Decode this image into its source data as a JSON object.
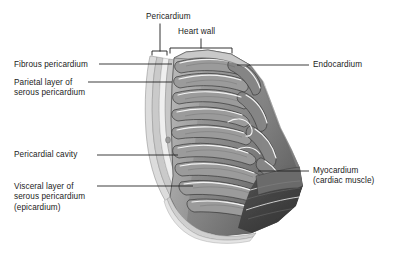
{
  "figure": {
    "type": "anatomical-illustration",
    "style": "grayscale textbook line-and-tone drawing",
    "background_color": "#ffffff",
    "line_color": "#1b1b1b",
    "text_color": "#1b1b1b"
  },
  "brackets": [
    {
      "id": "pericardium",
      "label": "Pericardium",
      "label_x": 146,
      "label_y": 12,
      "span_left": 152,
      "span_right": 167,
      "bracket_y": 51,
      "stem_x": 160,
      "stem_top": 24
    },
    {
      "id": "heart-wall",
      "label": "Heart wall",
      "label_x": 178,
      "label_y": 27,
      "span_left": 170,
      "span_right": 232,
      "bracket_y": 48,
      "stem_x": 201,
      "stem_top": 39
    }
  ],
  "labels": {
    "fibrous_pericardium": {
      "text": "Fibrous pericardium",
      "x": 14,
      "y": 60,
      "side": "left",
      "leader": {
        "x1": 99,
        "y1": 64,
        "x2": 172,
        "y2": 64
      }
    },
    "parietal_layer": {
      "line1": "Parietal layer of",
      "line2": "serous pericardium",
      "x": 14,
      "y": 78,
      "side": "left",
      "leader": {
        "x1": 88,
        "y1": 82,
        "x2": 172,
        "y2": 82
      }
    },
    "pericardial_cavity": {
      "text": "Pericardial cavity",
      "x": 14,
      "y": 150,
      "side": "left",
      "leader": {
        "x1": 97,
        "y1": 155,
        "x2": 178,
        "y2": 155
      }
    },
    "visceral_layer": {
      "line1": "Visceral layer of",
      "line2": "serous pericardium",
      "line3": "(epicardium)",
      "x": 14,
      "y": 182,
      "side": "left",
      "leader": {
        "x1": 97,
        "y1": 186,
        "x2": 193,
        "y2": 186
      }
    },
    "endocardium": {
      "text": "Endocardium",
      "x": 313,
      "y": 60,
      "side": "right",
      "leader": {
        "x1": 237,
        "y1": 65,
        "x2": 309,
        "y2": 65
      }
    },
    "myocardium": {
      "line1": "Myocardium",
      "line2": "(cardiac muscle)",
      "x": 313,
      "y": 166,
      "side": "right",
      "leader": {
        "x1": 258,
        "y1": 171,
        "x2": 309,
        "y2": 171
      }
    }
  },
  "tissue": {
    "outer_pericardium_tone": "#d9d9d9",
    "serous_layer_tone": "#c2c2c2",
    "cavity_tone": "#ededed",
    "myocardium_light": "#a8a8a8",
    "myocardium_mid": "#8d8d8d",
    "myocardium_dark": "#5e5e5e",
    "myocardium_deep": "#3f3f3f",
    "endocardium_highlight": "#f2f2f2"
  }
}
